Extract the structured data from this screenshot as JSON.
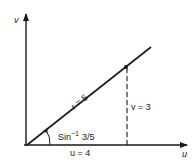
{
  "diagram": {
    "axes": {
      "vertical_label": "v",
      "horizontal_label": "u"
    },
    "labels": {
      "hypotenuse": "r = 5",
      "vertical_leg": "v = 3",
      "horizontal_leg": "u = 4",
      "angle_fn": "Sin",
      "angle_exp": "−1",
      "angle_arg": "3/5"
    },
    "colors": {
      "ink": "#1a1a1a",
      "background": "#ffffff"
    }
  }
}
